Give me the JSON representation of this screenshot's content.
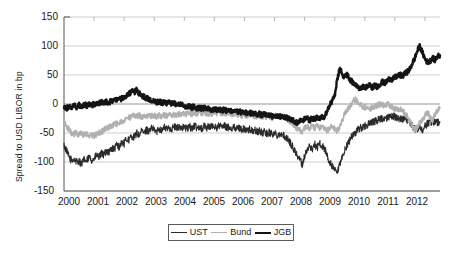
{
  "chart_data": {
    "type": "line",
    "title": "",
    "xlabel": "",
    "ylabel": "Spread to USD LIBOR in bp",
    "xlim": [
      2000,
      2012.5
    ],
    "ylim": [
      -150,
      150
    ],
    "grid": true,
    "legend_position": "bottom-center",
    "ytick_labels": [
      "150",
      "100",
      "50",
      "0",
      "-50",
      "-100",
      "-150"
    ],
    "ytick_values": [
      150,
      100,
      50,
      0,
      -50,
      -100,
      -150
    ],
    "xtick_labels": [
      "2000",
      "2001",
      "2002",
      "2003",
      "2004",
      "2005",
      "2006",
      "2007",
      "2008",
      "2009",
      "2010",
      "2011",
      "2012"
    ],
    "xtick_values": [
      2000,
      2001,
      2002,
      2003,
      2004,
      2005,
      2006,
      2007,
      2008,
      2009,
      2010,
      2011,
      2012
    ],
    "legend": [
      {
        "name": "UST",
        "color": "#2b2b2b",
        "width": 1.1
      },
      {
        "name": "Bund",
        "color": "#b0b0b0",
        "width": 1.6
      },
      {
        "name": "JGB",
        "color": "#141414",
        "width": 2.4
      }
    ],
    "series": [
      {
        "name": "UST",
        "color": "#2b2b2b",
        "width": 1.1,
        "x": [
          2000.0,
          2000.08,
          2000.17,
          2000.25,
          2000.33,
          2000.42,
          2000.5,
          2000.58,
          2000.67,
          2000.75,
          2000.83,
          2000.92,
          2001.0,
          2001.08,
          2001.17,
          2001.25,
          2001.33,
          2001.42,
          2001.5,
          2001.58,
          2001.67,
          2001.75,
          2001.83,
          2001.92,
          2002.0,
          2002.08,
          2002.17,
          2002.25,
          2002.33,
          2002.42,
          2002.5,
          2002.58,
          2002.67,
          2002.75,
          2002.83,
          2002.92,
          2003.0,
          2003.08,
          2003.17,
          2003.25,
          2003.33,
          2003.42,
          2003.5,
          2003.58,
          2003.67,
          2003.75,
          2003.83,
          2003.92,
          2004.0,
          2004.08,
          2004.17,
          2004.25,
          2004.33,
          2004.42,
          2004.5,
          2004.58,
          2004.67,
          2004.75,
          2004.83,
          2004.92,
          2005.0,
          2005.08,
          2005.17,
          2005.25,
          2005.33,
          2005.42,
          2005.5,
          2005.58,
          2005.67,
          2005.75,
          2005.83,
          2005.92,
          2006.0,
          2006.08,
          2006.17,
          2006.25,
          2006.33,
          2006.42,
          2006.5,
          2006.58,
          2006.67,
          2006.75,
          2006.83,
          2006.92,
          2007.0,
          2007.08,
          2007.17,
          2007.25,
          2007.33,
          2007.42,
          2007.5,
          2007.58,
          2007.67,
          2007.75,
          2007.83,
          2007.92,
          2008.0,
          2008.08,
          2008.17,
          2008.25,
          2008.33,
          2008.42,
          2008.5,
          2008.58,
          2008.67,
          2008.75,
          2008.83,
          2008.92,
          2009.0,
          2009.08,
          2009.17,
          2009.25,
          2009.33,
          2009.42,
          2009.5,
          2009.58,
          2009.67,
          2009.75,
          2009.83,
          2009.92,
          2010.0,
          2010.08,
          2010.17,
          2010.25,
          2010.33,
          2010.42,
          2010.5,
          2010.58,
          2010.67,
          2010.75,
          2010.83,
          2010.92,
          2011.0,
          2011.08,
          2011.17,
          2011.25,
          2011.33,
          2011.42,
          2011.5,
          2011.58,
          2011.67,
          2011.75,
          2011.83,
          2011.92,
          2012.0,
          2012.08,
          2012.17,
          2012.25,
          2012.33,
          2012.42,
          2012.5
        ],
        "values": [
          -72,
          -80,
          -92,
          -97,
          -95,
          -100,
          -98,
          -103,
          -96,
          -99,
          -92,
          -96,
          -95,
          -88,
          -92,
          -85,
          -88,
          -80,
          -83,
          -76,
          -78,
          -70,
          -74,
          -66,
          -68,
          -60,
          -62,
          -55,
          -58,
          -50,
          -54,
          -47,
          -50,
          -44,
          -47,
          -42,
          -45,
          -48,
          -42,
          -45,
          -40,
          -44,
          -40,
          -43,
          -39,
          -42,
          -38,
          -41,
          -40,
          -43,
          -39,
          -42,
          -38,
          -41,
          -39,
          -42,
          -38,
          -41,
          -38,
          -40,
          -38,
          -41,
          -37,
          -40,
          -38,
          -41,
          -39,
          -42,
          -40,
          -43,
          -41,
          -44,
          -43,
          -46,
          -44,
          -47,
          -45,
          -48,
          -47,
          -50,
          -48,
          -51,
          -49,
          -52,
          -50,
          -53,
          -51,
          -54,
          -55,
          -60,
          -65,
          -72,
          -80,
          -88,
          -95,
          -104,
          -90,
          -80,
          -72,
          -78,
          -70,
          -75,
          -68,
          -72,
          -78,
          -90,
          -100,
          -108,
          -115,
          -120,
          -105,
          -92,
          -80,
          -70,
          -62,
          -55,
          -50,
          -46,
          -42,
          -40,
          -38,
          -36,
          -34,
          -32,
          -30,
          -28,
          -26,
          -25,
          -28,
          -24,
          -22,
          -20,
          -22,
          -25,
          -24,
          -27,
          -26,
          -29,
          -32,
          -38,
          -44,
          -42,
          -40,
          -44,
          -38,
          -34,
          -30,
          -32,
          -30,
          -33,
          -31
        ]
      },
      {
        "name": "Bund",
        "color": "#b0b0b0",
        "width": 1.6,
        "x": [
          2000.0,
          2000.08,
          2000.17,
          2000.25,
          2000.33,
          2000.42,
          2000.5,
          2000.58,
          2000.67,
          2000.75,
          2000.83,
          2000.92,
          2001.0,
          2001.08,
          2001.17,
          2001.25,
          2001.33,
          2001.42,
          2001.5,
          2001.58,
          2001.67,
          2001.75,
          2001.83,
          2001.92,
          2002.0,
          2002.08,
          2002.17,
          2002.25,
          2002.33,
          2002.42,
          2002.5,
          2002.58,
          2002.67,
          2002.75,
          2002.83,
          2002.92,
          2003.0,
          2003.08,
          2003.17,
          2003.25,
          2003.33,
          2003.42,
          2003.5,
          2003.58,
          2003.67,
          2003.75,
          2003.83,
          2003.92,
          2004.0,
          2004.08,
          2004.17,
          2004.25,
          2004.33,
          2004.42,
          2004.5,
          2004.58,
          2004.67,
          2004.75,
          2004.83,
          2004.92,
          2005.0,
          2005.08,
          2005.17,
          2005.25,
          2005.33,
          2005.42,
          2005.5,
          2005.58,
          2005.67,
          2005.75,
          2005.83,
          2005.92,
          2006.0,
          2006.08,
          2006.17,
          2006.25,
          2006.33,
          2006.42,
          2006.5,
          2006.58,
          2006.67,
          2006.75,
          2006.83,
          2006.92,
          2007.0,
          2007.08,
          2007.17,
          2007.25,
          2007.33,
          2007.42,
          2007.5,
          2007.58,
          2007.67,
          2007.75,
          2007.83,
          2007.92,
          2008.0,
          2008.08,
          2008.17,
          2008.25,
          2008.33,
          2008.42,
          2008.5,
          2008.58,
          2008.67,
          2008.75,
          2008.83,
          2008.92,
          2009.0,
          2009.08,
          2009.17,
          2009.25,
          2009.33,
          2009.42,
          2009.5,
          2009.58,
          2009.67,
          2009.75,
          2009.83,
          2009.92,
          2010.0,
          2010.08,
          2010.17,
          2010.25,
          2010.33,
          2010.42,
          2010.5,
          2010.58,
          2010.67,
          2010.75,
          2010.83,
          2010.92,
          2011.0,
          2011.08,
          2011.17,
          2011.25,
          2011.33,
          2011.42,
          2011.5,
          2011.58,
          2011.67,
          2011.75,
          2011.83,
          2011.92,
          2012.0,
          2012.08,
          2012.17,
          2012.25,
          2012.33,
          2012.42,
          2012.5
        ],
        "values": [
          -30,
          -38,
          -45,
          -50,
          -52,
          -50,
          -53,
          -51,
          -54,
          -52,
          -55,
          -53,
          -55,
          -52,
          -50,
          -48,
          -45,
          -42,
          -40,
          -38,
          -36,
          -34,
          -32,
          -30,
          -28,
          -26,
          -24,
          -22,
          -20,
          -22,
          -20,
          -22,
          -20,
          -22,
          -20,
          -21,
          -20,
          -22,
          -20,
          -21,
          -19,
          -21,
          -18,
          -20,
          -18,
          -19,
          -17,
          -18,
          -16,
          -18,
          -15,
          -17,
          -14,
          -16,
          -14,
          -16,
          -15,
          -17,
          -16,
          -18,
          -14,
          -16,
          -14,
          -16,
          -15,
          -17,
          -16,
          -18,
          -17,
          -19,
          -18,
          -20,
          -18,
          -20,
          -19,
          -21,
          -20,
          -22,
          -20,
          -22,
          -21,
          -23,
          -22,
          -24,
          -20,
          -22,
          -21,
          -23,
          -24,
          -26,
          -30,
          -35,
          -38,
          -42,
          -45,
          -48,
          -42,
          -38,
          -42,
          -38,
          -42,
          -38,
          -42,
          -40,
          -44,
          -46,
          -42,
          -38,
          -44,
          -48,
          -38,
          -28,
          -18,
          -10,
          -4,
          2,
          8,
          5,
          0,
          -4,
          -6,
          -4,
          -8,
          -6,
          -4,
          -2,
          0,
          -2,
          -4,
          2,
          -2,
          -6,
          -8,
          -10,
          -8,
          -12,
          -16,
          -22,
          -30,
          -38,
          -44,
          -40,
          -32,
          -26,
          -20,
          -14,
          -22,
          -28,
          -18,
          -10,
          -6
        ]
      },
      {
        "name": "JGB",
        "color": "#141414",
        "width": 2.4,
        "x": [
          2000.0,
          2000.08,
          2000.17,
          2000.25,
          2000.33,
          2000.42,
          2000.5,
          2000.58,
          2000.67,
          2000.75,
          2000.83,
          2000.92,
          2001.0,
          2001.08,
          2001.17,
          2001.25,
          2001.33,
          2001.42,
          2001.5,
          2001.58,
          2001.67,
          2001.75,
          2001.83,
          2001.92,
          2002.0,
          2002.08,
          2002.17,
          2002.25,
          2002.33,
          2002.42,
          2002.5,
          2002.58,
          2002.67,
          2002.75,
          2002.83,
          2002.92,
          2003.0,
          2003.08,
          2003.17,
          2003.25,
          2003.33,
          2003.42,
          2003.5,
          2003.58,
          2003.67,
          2003.75,
          2003.83,
          2003.92,
          2004.0,
          2004.08,
          2004.17,
          2004.25,
          2004.33,
          2004.42,
          2004.5,
          2004.58,
          2004.67,
          2004.75,
          2004.83,
          2004.92,
          2005.0,
          2005.08,
          2005.17,
          2005.25,
          2005.33,
          2005.42,
          2005.5,
          2005.58,
          2005.67,
          2005.75,
          2005.83,
          2005.92,
          2006.0,
          2006.08,
          2006.17,
          2006.25,
          2006.33,
          2006.42,
          2006.5,
          2006.58,
          2006.67,
          2006.75,
          2006.83,
          2006.92,
          2007.0,
          2007.08,
          2007.17,
          2007.25,
          2007.33,
          2007.42,
          2007.5,
          2007.58,
          2007.67,
          2007.75,
          2007.83,
          2007.92,
          2008.0,
          2008.08,
          2008.17,
          2008.25,
          2008.33,
          2008.42,
          2008.5,
          2008.58,
          2008.67,
          2008.75,
          2008.83,
          2008.92,
          2009.0,
          2009.08,
          2009.17,
          2009.25,
          2009.33,
          2009.42,
          2009.5,
          2009.58,
          2009.67,
          2009.75,
          2009.83,
          2009.92,
          2010.0,
          2010.08,
          2010.17,
          2010.25,
          2010.33,
          2010.42,
          2010.5,
          2010.58,
          2010.67,
          2010.75,
          2010.83,
          2010.92,
          2011.0,
          2011.08,
          2011.17,
          2011.25,
          2011.33,
          2011.42,
          2011.5,
          2011.58,
          2011.67,
          2011.75,
          2011.83,
          2011.92,
          2012.0,
          2012.08,
          2012.17,
          2012.25,
          2012.33,
          2012.42,
          2012.5
        ],
        "values": [
          -5,
          -8,
          -4,
          -6,
          -3,
          -5,
          -2,
          -4,
          -1,
          -3,
          0,
          -2,
          0,
          2,
          1,
          3,
          2,
          4,
          3,
          5,
          6,
          8,
          7,
          9,
          12,
          15,
          18,
          22,
          20,
          24,
          18,
          15,
          12,
          10,
          8,
          6,
          5,
          3,
          4,
          2,
          3,
          1,
          2,
          0,
          1,
          -1,
          0,
          -2,
          -3,
          -5,
          -4,
          -6,
          -5,
          -7,
          -6,
          -8,
          -7,
          -9,
          -8,
          -10,
          -8,
          -10,
          -9,
          -11,
          -10,
          -12,
          -11,
          -13,
          -12,
          -14,
          -13,
          -15,
          -14,
          -16,
          -15,
          -17,
          -16,
          -18,
          -17,
          -19,
          -18,
          -20,
          -19,
          -21,
          -20,
          -22,
          -21,
          -23,
          -22,
          -24,
          -25,
          -28,
          -30,
          -32,
          -28,
          -30,
          -26,
          -24,
          -28,
          -24,
          -26,
          -22,
          -24,
          -20,
          -24,
          -10,
          -2,
          5,
          15,
          40,
          62,
          50,
          48,
          52,
          42,
          38,
          32,
          30,
          28,
          30,
          28,
          30,
          32,
          28,
          32,
          30,
          34,
          38,
          36,
          40,
          44,
          42,
          46,
          48,
          50,
          48,
          52,
          56,
          60,
          70,
          80,
          92,
          100,
          88,
          78,
          72,
          74,
          80,
          76,
          82,
          84
        ]
      }
    ]
  }
}
